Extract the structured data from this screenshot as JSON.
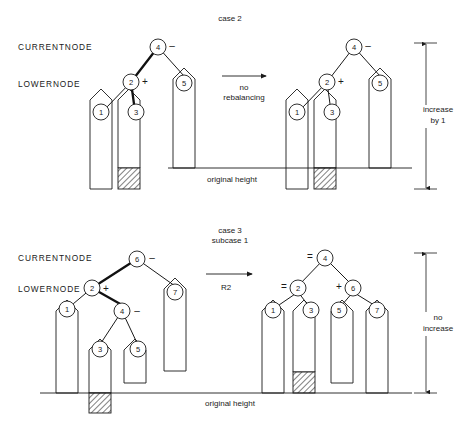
{
  "figure": {
    "width": 460,
    "height": 430,
    "background": "#ffffff",
    "ink": "#1a1a1a"
  },
  "panels": [
    {
      "id": "case-2",
      "title": "case 2",
      "subtitle": "",
      "row_labels": {
        "current": "CURRENTNODE",
        "lower": "LOWERNODE"
      },
      "transform_label_line1": "no",
      "transform_label_line2": "rebalancing",
      "baseline_label": "original height",
      "measure_label_line1": "increase",
      "measure_label_line2": "by 1",
      "before": {
        "nodes": [
          {
            "key": "4",
            "sign": "–"
          },
          {
            "key": "2",
            "sign": "+"
          },
          {
            "key": "5",
            "sign": ""
          },
          {
            "key": "1",
            "sign": ""
          },
          {
            "key": "3",
            "sign": ""
          }
        ]
      },
      "after": {
        "nodes": [
          {
            "key": "4",
            "sign": "–"
          },
          {
            "key": "2",
            "sign": "+"
          },
          {
            "key": "5",
            "sign": ""
          },
          {
            "key": "1",
            "sign": ""
          },
          {
            "key": "3",
            "sign": ""
          }
        ]
      }
    },
    {
      "id": "case-3-subcase-1",
      "title": "case 3",
      "subtitle": "subcase 1",
      "row_labels": {
        "current": "CURRENTNODE",
        "lower": "LOWERNODE"
      },
      "transform_label_line1": "R2",
      "transform_label_line2": "",
      "baseline_label": "original height",
      "measure_label_line1": "no",
      "measure_label_line2": "increase",
      "before": {
        "nodes": [
          {
            "key": "6",
            "sign": "–"
          },
          {
            "key": "2",
            "sign": "+"
          },
          {
            "key": "4",
            "sign": "–"
          },
          {
            "key": "7",
            "sign": ""
          },
          {
            "key": "1",
            "sign": ""
          },
          {
            "key": "3",
            "sign": ""
          },
          {
            "key": "5",
            "sign": ""
          }
        ]
      },
      "after": {
        "nodes": [
          {
            "key": "4",
            "sign": "="
          },
          {
            "key": "2",
            "sign": "="
          },
          {
            "key": "6",
            "sign": "+"
          },
          {
            "key": "1",
            "sign": ""
          },
          {
            "key": "3",
            "sign": ""
          },
          {
            "key": "5",
            "sign": ""
          },
          {
            "key": "7",
            "sign": ""
          }
        ]
      }
    }
  ],
  "text": {
    "case2_title": "case 2",
    "case2_current": "CURRENTNODE",
    "case2_lower": "LOWERNODE",
    "case2_arrow_l1": "no",
    "case2_arrow_l2": "rebalancing",
    "case2_baseline": "original height",
    "case2_meas_l1": "increase",
    "case2_meas_l2": "by 1",
    "case2_n4a": "4",
    "case2_n4a_sign": "–",
    "case2_n2a": "2",
    "case2_n2a_sign": "+",
    "case2_n5a": "5",
    "case2_n1a": "1",
    "case2_n3a": "3",
    "case2_n4b": "4",
    "case2_n4b_sign": "–",
    "case2_n2b": "2",
    "case2_n2b_sign": "+",
    "case2_n5b": "5",
    "case2_n1b": "1",
    "case2_n3b": "3",
    "case3_title": "case 3",
    "case3_subtitle": "subcase 1",
    "case3_current": "CURRENTNODE",
    "case3_lower": "LOWERNODE",
    "case3_arrow_l1": "R2",
    "case3_baseline": "original height",
    "case3_meas_l1": "no",
    "case3_meas_l2": "increase",
    "case3_n6a": "6",
    "case3_n6a_sign": "–",
    "case3_n2a": "2",
    "case3_n2a_sign": "+",
    "case3_n4a": "4",
    "case3_n4a_sign": "–",
    "case3_n7a": "7",
    "case3_n1a": "1",
    "case3_n3a": "3",
    "case3_n5a": "5",
    "case3_n4b": "4",
    "case3_n4b_sign": "=",
    "case3_n2b": "2",
    "case3_n2b_sign": "=",
    "case3_n6b": "6",
    "case3_n6b_sign": "+",
    "case3_n1b": "1",
    "case3_n3b": "3",
    "case3_n5b": "5",
    "case3_n7b": "7"
  }
}
